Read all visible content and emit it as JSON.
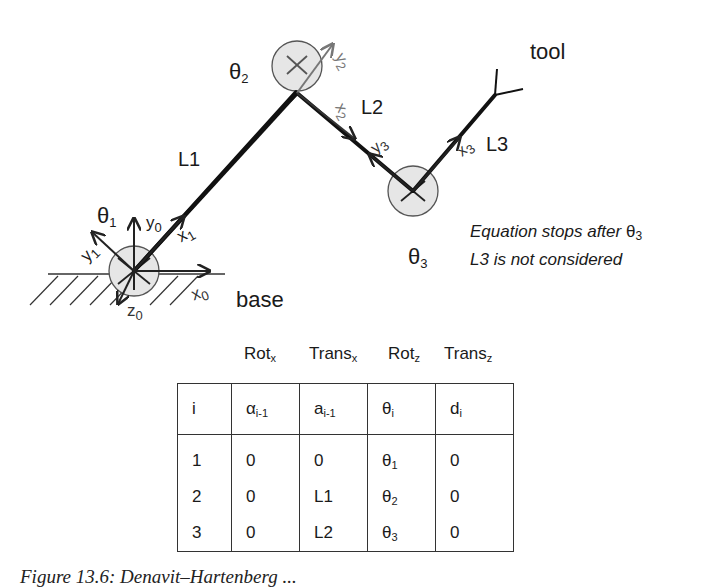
{
  "diagram": {
    "joints": [
      {
        "id": "theta1",
        "label": "θ",
        "sub": "1",
        "x": 134,
        "y": 271
      },
      {
        "id": "theta2",
        "label": "θ",
        "sub": "2",
        "x": 297,
        "y": 64
      },
      {
        "id": "theta3",
        "label": "θ",
        "sub": "3",
        "x": 413,
        "y": 191
      }
    ],
    "links": [
      {
        "label": "L1"
      },
      {
        "label": "L2"
      },
      {
        "label": "L3"
      }
    ],
    "frame_labels": {
      "y0": {
        "base": "y",
        "sub": "0"
      },
      "x0": {
        "base": "x",
        "sub": "0"
      },
      "z0": {
        "base": "z",
        "sub": "0"
      },
      "x1": {
        "base": "x",
        "sub": "1"
      },
      "y1": {
        "base": "y",
        "sub": "1"
      },
      "x2": {
        "base": "x",
        "sub": "2"
      },
      "y2": {
        "base": "y",
        "sub": "2"
      },
      "x3": {
        "base": "x",
        "sub": "3"
      },
      "y3": {
        "base": "y",
        "sub": "3"
      }
    },
    "base_label": "base",
    "tool_label": "tool",
    "note": {
      "line1_prefix": "Equation stops after ",
      "line1_symbol": "θ",
      "line1_sub": "3",
      "line2": "L3 is not considered"
    }
  },
  "table": {
    "operation_headers": [
      {
        "base": "Rot",
        "sub": "x"
      },
      {
        "base": "Trans",
        "sub": "x"
      },
      {
        "base": "Rot",
        "sub": "z"
      },
      {
        "base": "Trans",
        "sub": "z"
      }
    ],
    "columns": [
      {
        "base": "i",
        "sub": ""
      },
      {
        "base": "α",
        "sub": "i-1"
      },
      {
        "base": "a",
        "sub": "i-1"
      },
      {
        "base": "θ",
        "sub": "i"
      },
      {
        "base": "d",
        "sub": "i"
      }
    ],
    "rows": [
      {
        "i": "1",
        "alpha": "0",
        "a": "0",
        "theta": "θ",
        "theta_sub": "1",
        "d": "0"
      },
      {
        "i": "2",
        "alpha": "0",
        "a": "L1",
        "theta": "θ",
        "theta_sub": "2",
        "d": "0"
      },
      {
        "i": "3",
        "alpha": "0",
        "a": "L2",
        "theta": "θ",
        "theta_sub": "3",
        "d": "0"
      }
    ]
  },
  "caption": "Figure 13.6: Denavit–Hartenberg ..."
}
